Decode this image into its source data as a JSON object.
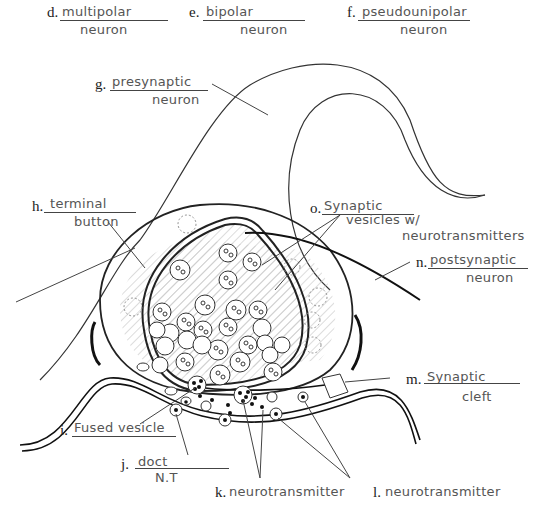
{
  "diagram": {
    "labels": [
      {
        "id": "d",
        "letter": "d.",
        "answer": "multipolar",
        "answer_line2": "neuron"
      },
      {
        "id": "e",
        "letter": "e.",
        "answer": "bipolar",
        "answer_line2": "neuron"
      },
      {
        "id": "f",
        "letter": "f.",
        "answer": "pseudounipolar",
        "answer_line2": "neuron"
      },
      {
        "id": "g",
        "letter": "g.",
        "answer": "presynaptic",
        "answer_line2": "neuron"
      },
      {
        "id": "h",
        "letter": "h.",
        "answer": "terminal",
        "answer_line2": "button"
      },
      {
        "id": "o",
        "letter": "o.",
        "answer": "Synaptic",
        "answer_line2": "vesicles w/",
        "answer_line3": "neurotransmitters"
      },
      {
        "id": "n",
        "letter": "n.",
        "answer": "postsynaptic",
        "answer_line2": "neuron"
      },
      {
        "id": "m",
        "letter": "m.",
        "answer": "Synaptic",
        "answer_line2": "cleft"
      },
      {
        "id": "i",
        "letter": "i.",
        "answer": "Fused vesicle"
      },
      {
        "id": "j",
        "letter": "j.",
        "answer": "doct",
        "answer_line2": "N.T"
      },
      {
        "id": "k",
        "letter": "k.",
        "answer": "neurotransmitter"
      },
      {
        "id": "l",
        "letter": "l.",
        "answer": "neurotransmitter"
      }
    ],
    "colors": {
      "ink": "#222222",
      "handwriting": "#555555",
      "hatch": "#bbbbbb",
      "background": "#ffffff"
    }
  }
}
